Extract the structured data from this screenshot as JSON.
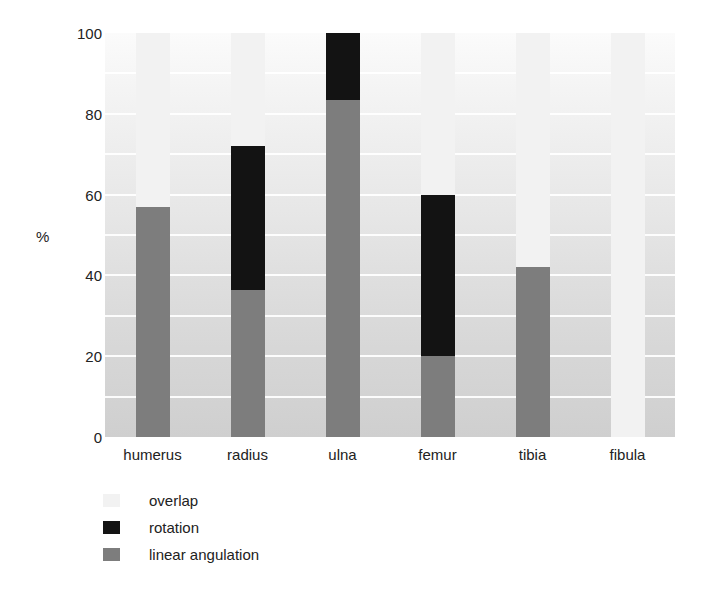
{
  "chart_data": {
    "type": "bar",
    "subtype": "stacked-bar",
    "title": "",
    "xlabel": "",
    "ylabel": "%",
    "ylim": [
      0,
      100
    ],
    "yticks": [
      0,
      20,
      40,
      60,
      80,
      100
    ],
    "ytick_labels": [
      "0",
      "20",
      "40",
      "60",
      "80",
      "100"
    ],
    "gridlines_at": [
      10,
      20,
      30,
      40,
      50,
      60,
      70,
      80,
      90
    ],
    "grid": true,
    "grid_color": "#ffffff",
    "legend_position": "below-left",
    "categories": [
      "humerus",
      "radius",
      "ulna",
      "femur",
      "tibia",
      "fibula"
    ],
    "series": [
      {
        "name": "linear angulation",
        "color": "#7d7d7d",
        "values": [
          57,
          36.5,
          83.5,
          20,
          42,
          0
        ]
      },
      {
        "name": "rotation",
        "color": "#131313",
        "values": [
          0,
          35.5,
          16.5,
          40,
          0,
          0
        ]
      },
      {
        "name": "overlap",
        "color": "#f2f2f2",
        "values": [
          43,
          28,
          0,
          40,
          58,
          100
        ]
      }
    ],
    "stack_order_bottom_to_top": [
      "linear angulation",
      "rotation",
      "overlap"
    ],
    "bars": [
      {
        "category": "humerus",
        "linear_angulation": 57,
        "rotation": 0,
        "overlap": 43,
        "boundaries": {
          "linear_top": 57,
          "rotation_top": 57,
          "overlap_top": 100
        }
      },
      {
        "category": "radius",
        "linear_angulation": 36.5,
        "rotation": 35.5,
        "overlap": 28,
        "boundaries": {
          "linear_top": 36.5,
          "rotation_top": 72,
          "overlap_top": 100
        }
      },
      {
        "category": "ulna",
        "linear_angulation": 83.5,
        "rotation": 16.5,
        "overlap": 0,
        "boundaries": {
          "linear_top": 83.5,
          "rotation_top": 100,
          "overlap_top": 100
        }
      },
      {
        "category": "femur",
        "linear_angulation": 20,
        "rotation": 40,
        "overlap": 40,
        "boundaries": {
          "linear_top": 20,
          "rotation_top": 60,
          "overlap_top": 100
        }
      },
      {
        "category": "tibia",
        "linear_angulation": 42,
        "rotation": 0,
        "overlap": 58,
        "boundaries": {
          "linear_top": 42,
          "rotation_top": 42,
          "overlap_top": 100
        }
      },
      {
        "category": "fibula",
        "linear_angulation": 0,
        "rotation": 0,
        "overlap": 100,
        "boundaries": {
          "linear_top": 0,
          "rotation_top": 0,
          "overlap_top": 100
        }
      }
    ]
  },
  "axis": {
    "y_title": "%",
    "y_ticks": [
      {
        "label": "100",
        "value": 100
      },
      {
        "label": "80",
        "value": 80
      },
      {
        "label": "60",
        "value": 60
      },
      {
        "label": "40",
        "value": 40
      },
      {
        "label": "20",
        "value": 20
      },
      {
        "label": "0",
        "value": 0
      }
    ],
    "x_labels": [
      "humerus",
      "radius",
      "ulna",
      "femur",
      "tibia",
      "fibula"
    ]
  },
  "legend": {
    "items": [
      {
        "label": "overlap",
        "color": "#f2f2f2"
      },
      {
        "label": "rotation",
        "color": "#131313"
      },
      {
        "label": "linear angulation",
        "color": "#7d7d7d"
      }
    ]
  }
}
